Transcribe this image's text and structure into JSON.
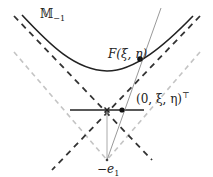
{
  "diagram": {
    "labels": {
      "manifold": "𝕄",
      "manifold_sub": "−1",
      "point_F": "F(ξ, η)",
      "point_plane": "(0, ξ, η)",
      "point_plane_sup": "⊤",
      "origin_neg": "−e",
      "origin_neg_sub": "1"
    },
    "colors": {
      "curve": "#222222",
      "dashed_dark": "#333333",
      "dashed_light": "#bbbbbb",
      "thin_line": "#999999",
      "point": "#111111"
    }
  }
}
